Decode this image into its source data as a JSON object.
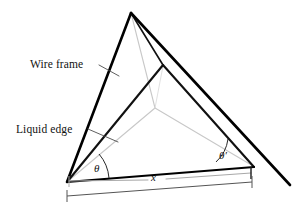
{
  "figure": {
    "domain": "Diagram",
    "background_color": "#ffffff",
    "width": 298,
    "height": 212
  },
  "labels": {
    "wire_frame": "Wire frame",
    "liquid_edge": "Liquid edge",
    "theta": "θ",
    "theta_prime": "θ′",
    "x": "x"
  },
  "colors": {
    "wire_frame_stroke": "#000000",
    "liquid_edge_dark_stroke": "#111111",
    "liquid_edge_light_stroke": "#c8c8c8",
    "dimension_dark_stroke": "#1a1a1a",
    "dimension_light_stroke": "#b4b4b4",
    "leader_stroke": "#4d4d4d",
    "text": "#111111"
  },
  "geometry": {
    "apex": [
      131,
      13
    ],
    "left_vertex": [
      67,
      182
    ],
    "right_vertex": [
      254,
      166
    ],
    "wire_frame_tail": [
      290,
      185
    ],
    "inner_dark_vertex": [
      163,
      65
    ],
    "steiner_point": [
      155,
      108
    ],
    "angle_theta_degrees": 25,
    "angle_theta_prime_degrees": 26
  },
  "annotations": {
    "wire_frame_leader": {
      "from": [
        101,
        66
      ],
      "to": [
        118,
        74
      ]
    },
    "liquid_edge_leader": {
      "from": [
        90,
        130
      ],
      "to": [
        116,
        141
      ]
    },
    "dimension_x_span": {
      "from": [
        67,
        180
      ],
      "to": [
        252,
        166
      ]
    },
    "dimension_base_span": {
      "from": [
        67,
        196
      ],
      "to": [
        252,
        182
      ]
    }
  }
}
